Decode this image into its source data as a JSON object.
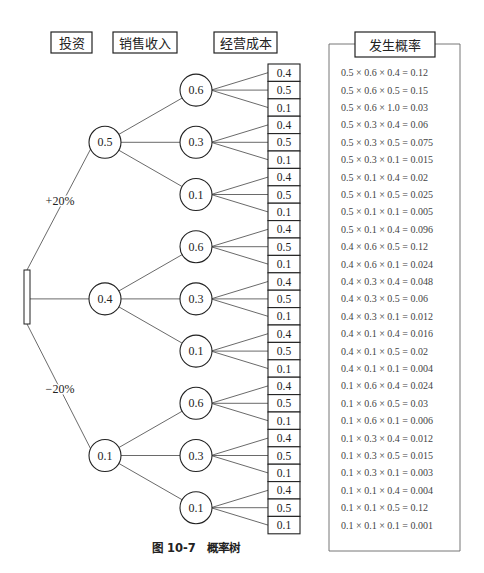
{
  "headers": {
    "investment": "投资",
    "sales_revenue": "销售收入",
    "operating_cost": "经营成本",
    "probability": "发生概率"
  },
  "branch_labels": {
    "up": "+20%",
    "down": "−20%"
  },
  "level1": [
    {
      "label": "0.5"
    },
    {
      "label": "0.4"
    },
    {
      "label": "0.1"
    }
  ],
  "level2": [
    {
      "label": "0.6"
    },
    {
      "label": "0.3"
    },
    {
      "label": "0.1"
    },
    {
      "label": "0.6"
    },
    {
      "label": "0.3"
    },
    {
      "label": "0.1"
    },
    {
      "label": "0.6"
    },
    {
      "label": "0.3"
    },
    {
      "label": "0.1"
    }
  ],
  "leaves": [
    "0.4",
    "0.5",
    "0.1",
    "0.4",
    "0.5",
    "0.1",
    "0.4",
    "0.5",
    "0.1",
    "0.4",
    "0.5",
    "0.1",
    "0.4",
    "0.5",
    "0.1",
    "0.4",
    "0.5",
    "0.1",
    "0.4",
    "0.5",
    "0.1",
    "0.4",
    "0.5",
    "0.1",
    "0.4",
    "0.5",
    "0.1"
  ],
  "formulas": [
    "0.5 × 0.6 × 0.4 = 0.12",
    "0.5 × 0.6 × 0.5 = 0.15",
    "0.5 × 0.6 × 1.0 = 0.03",
    "0.5 × 0.3 × 0.4 = 0.06",
    "0.5 × 0.3 × 0.5 = 0.075",
    "0.5 × 0.3 × 0.1 = 0.015",
    "0.5 × 0.1 × 0.4 = 0.02",
    "0.5 × 0.1 × 0.5 = 0.025",
    "0.5 × 0.1 × 0.1 = 0.005",
    "0.5 × 0.1 × 0.4 = 0.096",
    "0.4 × 0.6 × 0.5 = 0.12",
    "0.4 × 0.6 × 0.1 = 0.024",
    "0.4 × 0.3 × 0.4 = 0.048",
    "0.4 × 0.3 × 0.5 = 0.06",
    "0.4 × 0.3 × 0.1 = 0.012",
    "0.4 × 0.1 × 0.4 = 0.016",
    "0.4 × 0.1 × 0.5 = 0.02",
    "0.4 × 0.1 × 0.1 = 0.004",
    "0.1 × 0.6 × 0.4 = 0.024",
    "0.1 × 0.6 × 0.5 = 0.03",
    "0.1 × 0.6 × 0.1 = 0.006",
    "0.1 × 0.3 × 0.4 = 0.012",
    "0.1 × 0.3 × 0.5 = 0.015",
    "0.1 × 0.3 × 0.1 = 0.003",
    "0.1 × 0.1 × 0.4 = 0.004",
    "0.1 × 0.1 × 0.5 = 0.12",
    "0.1 × 0.1 × 0.1 = 0.001"
  ],
  "caption": "图 10-7　概率树",
  "colors": {
    "line": "#333333",
    "text": "#222222",
    "formula": "#444444",
    "frame": "#666666"
  }
}
